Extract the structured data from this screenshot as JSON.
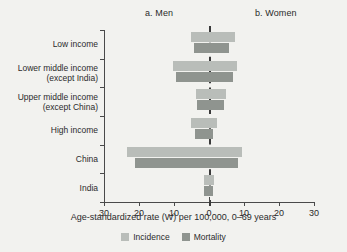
{
  "panels": {
    "left_title": "a. Men",
    "right_title": "b. Women"
  },
  "axis": {
    "x_title": "Age-standardized rate (W) per 100,000, 0–69 years",
    "x_ticks": [
      "30",
      "20",
      "10",
      "0",
      "10",
      "20",
      "30"
    ]
  },
  "legend": {
    "incidence_label": "Incidence",
    "mortality_label": "Mortality",
    "incidence_color": "#b9bdb9",
    "mortality_color": "#8f948f"
  },
  "chart_data": {
    "type": "bar",
    "orientation": "horizontal",
    "style": "diverging-population-pyramid",
    "title": "",
    "xlabel": "Age-standardized rate (W) per 100,000, 0–69 years",
    "ylabel": "",
    "xlim": [
      -30,
      30
    ],
    "xticks": [
      -30,
      -20,
      -10,
      0,
      10,
      20,
      30
    ],
    "xticklabels": [
      "30",
      "20",
      "10",
      "0",
      "10",
      "20",
      "30"
    ],
    "grid": false,
    "legend_position": "bottom",
    "panel_labels": [
      "a. Men",
      "b. Women"
    ],
    "categories": [
      "Low income",
      "Lower middle income (except India)",
      "Upper middle income (except China)",
      "High income",
      "China",
      "India"
    ],
    "category_labels_multiline": [
      "Low income",
      "Lower middle income\n(except India)",
      "Upper middle income\n(except China)",
      "High income",
      "China",
      "India"
    ],
    "series": [
      {
        "name": "Incidence",
        "color": "#b9bdb9",
        "men": [
          5.1,
          10.3,
          3.7,
          5.2,
          23.4,
          1.4
        ],
        "women": [
          7.4,
          8.0,
          4.9,
          2.4,
          9.4,
          1.3
        ]
      },
      {
        "name": "Mortality",
        "color": "#8f948f",
        "men": [
          4.3,
          9.4,
          3.4,
          4.0,
          21.1,
          1.4
        ],
        "women": [
          5.7,
          6.9,
          4.2,
          1.1,
          8.3,
          1.2
        ]
      }
    ]
  }
}
